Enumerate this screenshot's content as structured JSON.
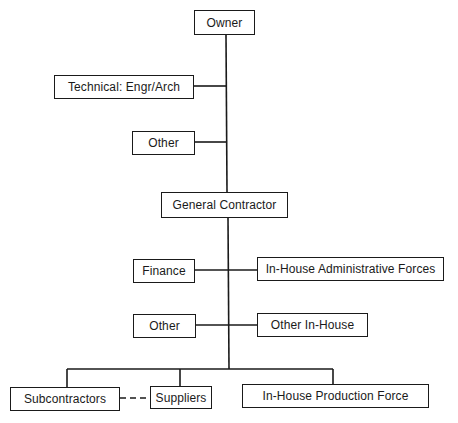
{
  "diagram": {
    "type": "org-chart",
    "line_color": "#1a1a1a",
    "nodes": {
      "owner": {
        "label": "Owner"
      },
      "technical": {
        "label": "Technical: Engr/Arch"
      },
      "other_owner": {
        "label": "Other"
      },
      "general_contractor": {
        "label": "General Contractor"
      },
      "finance": {
        "label": "Finance"
      },
      "inhouse_admin": {
        "label": "In-House Administrative Forces"
      },
      "other_gc": {
        "label": "Other"
      },
      "other_inhouse": {
        "label": "Other In-House"
      },
      "subcontractors": {
        "label": "Subcontractors"
      },
      "suppliers": {
        "label": "Suppliers"
      },
      "inhouse_production": {
        "label": "In-House Production Force"
      }
    },
    "edges": [
      {
        "from": "owner",
        "to": "technical",
        "style": "solid"
      },
      {
        "from": "owner",
        "to": "other_owner",
        "style": "solid"
      },
      {
        "from": "owner",
        "to": "general_contractor",
        "style": "solid"
      },
      {
        "from": "general_contractor",
        "to": "finance",
        "style": "solid"
      },
      {
        "from": "general_contractor",
        "to": "inhouse_admin",
        "style": "solid"
      },
      {
        "from": "general_contractor",
        "to": "other_gc",
        "style": "solid"
      },
      {
        "from": "general_contractor",
        "to": "other_inhouse",
        "style": "solid"
      },
      {
        "from": "general_contractor",
        "to": "subcontractors",
        "style": "solid"
      },
      {
        "from": "general_contractor",
        "to": "suppliers",
        "style": "solid"
      },
      {
        "from": "general_contractor",
        "to": "inhouse_production",
        "style": "solid"
      },
      {
        "from": "subcontractors",
        "to": "suppliers",
        "style": "dashed"
      }
    ]
  }
}
